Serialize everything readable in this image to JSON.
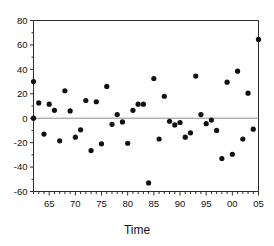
{
  "chart_data": {
    "type": "scatter",
    "title": "",
    "xlabel": "Time",
    "ylabel": "",
    "xlim": [
      1962,
      2005
    ],
    "ylim": [
      -60,
      80
    ],
    "grid": false,
    "legend": null,
    "reference_line": {
      "axis": "y",
      "value": 0,
      "color": "#8f8f8f"
    },
    "marker": {
      "shape": "circle",
      "color": "#111111",
      "size": 2.6
    },
    "ytick_labels": [
      "80",
      "60",
      "40",
      "20",
      "0",
      "-20",
      "-40",
      "-60"
    ],
    "ytick_values": [
      80,
      60,
      40,
      20,
      0,
      -20,
      -40,
      -60
    ],
    "ytick_minor_step": 10,
    "xtick_labels": [
      "65",
      "70",
      "75",
      "80",
      "85",
      "90",
      "95",
      "00",
      "05"
    ],
    "xtick_values": [
      1965,
      1970,
      1975,
      1980,
      1985,
      1990,
      1995,
      2000,
      2005
    ],
    "xtick_minor_step": 1,
    "x": [
      1962,
      1962,
      1963,
      1964,
      1965,
      1965,
      1966,
      1967,
      1968,
      1969,
      1970,
      1971,
      1971,
      1972,
      1973,
      1973,
      1974,
      1975,
      1976,
      1977,
      1978,
      1978,
      1979,
      1980,
      1981,
      1982,
      1983,
      1983,
      1984,
      1985,
      1986,
      1987,
      1988,
      1989,
      1990,
      1990,
      1991,
      1992,
      1993,
      1994,
      1995,
      1995,
      1996,
      1997,
      1998,
      1999,
      2000,
      2001,
      2002,
      2003,
      2004,
      2005
    ],
    "y": [
      30,
      0,
      12.5,
      -13,
      11.5,
      6.5,
      -18.5,
      22.5,
      6,
      -15.5,
      -9.5,
      14.5,
      -26.5,
      13.5,
      -21,
      26,
      -5,
      3,
      -3,
      -20.5,
      6.5,
      11.5,
      11.5,
      -53,
      32.5,
      -17,
      18,
      -2.5,
      -5.5,
      -3.5,
      -15.5,
      -12,
      34.5,
      3,
      -4.5,
      -1.5,
      -10,
      -33,
      29.5,
      -29.5,
      38.5,
      -17,
      20.5,
      -9,
      64.5,
      0,
      0,
      0,
      0,
      0,
      0,
      0
    ],
    "points": [
      {
        "x": 1962,
        "y": 30
      },
      {
        "x": 1962,
        "y": 0
      },
      {
        "x": 1963,
        "y": 12.5
      },
      {
        "x": 1964,
        "y": -13
      },
      {
        "x": 1965,
        "y": 11.5
      },
      {
        "x": 1966,
        "y": 6.5
      },
      {
        "x": 1967,
        "y": -18.5
      },
      {
        "x": 1968,
        "y": 22.5
      },
      {
        "x": 1969,
        "y": 6
      },
      {
        "x": 1970,
        "y": -15.5
      },
      {
        "x": 1971,
        "y": -9.5
      },
      {
        "x": 1972,
        "y": 14.5
      },
      {
        "x": 1973,
        "y": -26.5
      },
      {
        "x": 1974,
        "y": 13.5
      },
      {
        "x": 1975,
        "y": -21
      },
      {
        "x": 1976,
        "y": 26
      },
      {
        "x": 1977,
        "y": -5
      },
      {
        "x": 1978,
        "y": 3
      },
      {
        "x": 1979,
        "y": -3
      },
      {
        "x": 1980,
        "y": -20.5
      },
      {
        "x": 1981,
        "y": 6.5
      },
      {
        "x": 1982,
        "y": 11.5
      },
      {
        "x": 1983,
        "y": 11.5
      },
      {
        "x": 1984,
        "y": -53
      },
      {
        "x": 1985,
        "y": 32.5
      },
      {
        "x": 1986,
        "y": -17
      },
      {
        "x": 1987,
        "y": 18
      },
      {
        "x": 1988,
        "y": -2.5
      },
      {
        "x": 1989,
        "y": -5.5
      },
      {
        "x": 1990,
        "y": -3.5
      },
      {
        "x": 1991,
        "y": -15.5
      },
      {
        "x": 1992,
        "y": -12
      },
      {
        "x": 1993,
        "y": 34.5
      },
      {
        "x": 1994,
        "y": 3
      },
      {
        "x": 1995,
        "y": -4.5
      },
      {
        "x": 1996,
        "y": -1.5
      },
      {
        "x": 1997,
        "y": -10
      },
      {
        "x": 1998,
        "y": -33
      },
      {
        "x": 1999,
        "y": 29.5
      },
      {
        "x": 2000,
        "y": -29.5
      },
      {
        "x": 2001,
        "y": 38.5
      },
      {
        "x": 2002,
        "y": -17
      },
      {
        "x": 2003,
        "y": 20.5
      },
      {
        "x": 2004,
        "y": -9
      },
      {
        "x": 2005,
        "y": 64.5
      }
    ]
  }
}
